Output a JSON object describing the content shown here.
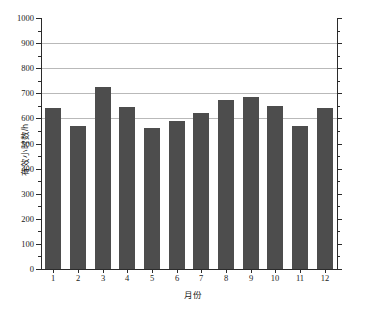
{
  "chart_data": {
    "type": "bar",
    "title": "",
    "xlabel": "月份",
    "ylabel": "有效小时数/h",
    "categories": [
      "1",
      "2",
      "3",
      "4",
      "5",
      "6",
      "7",
      "8",
      "9",
      "10",
      "11",
      "12"
    ],
    "values": [
      643,
      568,
      725,
      646,
      560,
      589,
      623,
      672,
      687,
      648,
      568,
      641
    ],
    "ylim": [
      0,
      1000
    ],
    "ytick_labels": [
      "0",
      "100",
      "200",
      "300",
      "400",
      "500",
      "600",
      "700",
      "800",
      "900",
      "1000"
    ],
    "ytick_values": [
      0,
      100,
      200,
      300,
      400,
      500,
      600,
      700,
      800,
      900,
      1000
    ],
    "ytick_minor_step": 50,
    "gridlines_at": [
      600,
      700,
      800,
      900
    ],
    "grid": true,
    "legend": false,
    "bar_color": "#4d4d4d",
    "grid_color": "#b9b9b9",
    "axis_color": "#2b2b2b",
    "background": "#ffffff"
  }
}
